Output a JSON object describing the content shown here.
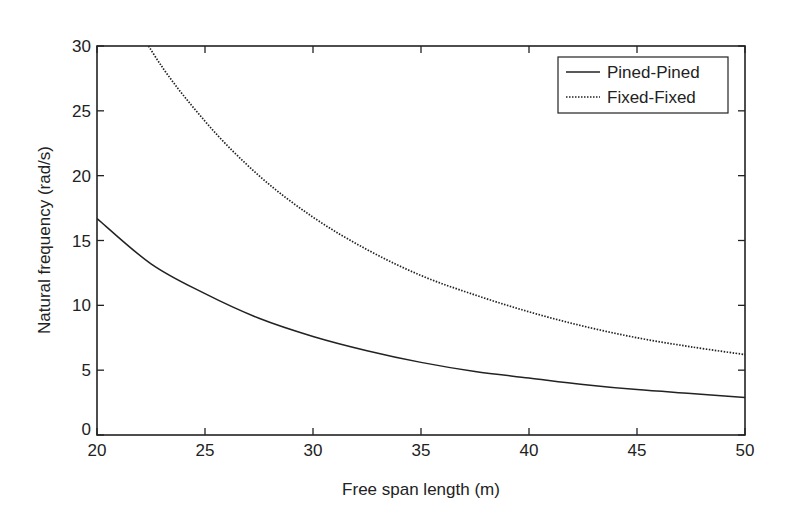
{
  "chart_data": {
    "type": "line",
    "title": "",
    "xlabel": "Free span length (m)",
    "ylabel": "Natural frequency (rad/s)",
    "xlim": [
      20,
      50
    ],
    "ylim": [
      0,
      30
    ],
    "xticks": [
      20,
      25,
      30,
      35,
      40,
      45,
      50
    ],
    "yticks": [
      0,
      5,
      10,
      15,
      20,
      25,
      30
    ],
    "grid": false,
    "legend_position": "upper right",
    "x": [
      20,
      22.5,
      25,
      27.5,
      30,
      32.5,
      35,
      37.5,
      40,
      42.5,
      45,
      47.5,
      50
    ],
    "series": [
      {
        "name": "Pined-Pined",
        "style": "solid",
        "values": [
          16.7,
          13.2,
          10.9,
          9.0,
          7.6,
          6.5,
          5.6,
          4.9,
          4.4,
          3.9,
          3.5,
          3.2,
          2.9
        ]
      },
      {
        "name": "Fixed-Fixed",
        "style": "dotted",
        "values": [
          37.6,
          29.7,
          24.2,
          20.0,
          16.8,
          14.3,
          12.3,
          10.8,
          9.5,
          8.4,
          7.5,
          6.8,
          6.2
        ]
      }
    ]
  }
}
